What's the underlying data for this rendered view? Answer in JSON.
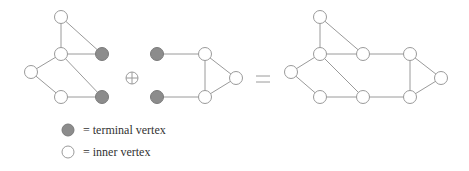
{
  "diagram": {
    "operator_symbol": "⊕",
    "equals_symbol": "=",
    "colors": {
      "edge": "#9a9a9a",
      "terminal_fill": "#8c8c8c",
      "inner_fill": "#ffffff"
    },
    "left_graph": {
      "nodes": [
        {
          "id": "a",
          "x": 61,
          "y": 17,
          "type": "inner"
        },
        {
          "id": "b",
          "x": 61,
          "y": 54,
          "type": "inner"
        },
        {
          "id": "c",
          "x": 31,
          "y": 72,
          "type": "inner"
        },
        {
          "id": "d",
          "x": 61,
          "y": 97,
          "type": "inner"
        },
        {
          "id": "t1",
          "x": 102,
          "y": 54,
          "type": "terminal"
        },
        {
          "id": "t2",
          "x": 102,
          "y": 97,
          "type": "terminal"
        }
      ],
      "edges": [
        [
          "a",
          "b"
        ],
        [
          "a",
          "t1"
        ],
        [
          "b",
          "t1"
        ],
        [
          "b",
          "c"
        ],
        [
          "b",
          "t2"
        ],
        [
          "c",
          "d"
        ],
        [
          "d",
          "t2"
        ]
      ]
    },
    "middle_graph": {
      "nodes": [
        {
          "id": "t1",
          "x": 157,
          "y": 54,
          "type": "terminal"
        },
        {
          "id": "t2",
          "x": 157,
          "y": 97,
          "type": "terminal"
        },
        {
          "id": "e",
          "x": 205,
          "y": 54,
          "type": "inner"
        },
        {
          "id": "f",
          "x": 205,
          "y": 97,
          "type": "inner"
        },
        {
          "id": "g",
          "x": 236,
          "y": 78,
          "type": "inner"
        }
      ],
      "edges": [
        [
          "t1",
          "e"
        ],
        [
          "t2",
          "f"
        ],
        [
          "e",
          "f"
        ],
        [
          "e",
          "g"
        ],
        [
          "f",
          "g"
        ]
      ]
    },
    "result_graph": {
      "nodes": [
        {
          "id": "a",
          "x": 320,
          "y": 17,
          "type": "inner"
        },
        {
          "id": "b",
          "x": 320,
          "y": 54,
          "type": "inner"
        },
        {
          "id": "c",
          "x": 291,
          "y": 72,
          "type": "inner"
        },
        {
          "id": "d",
          "x": 320,
          "y": 97,
          "type": "inner"
        },
        {
          "id": "t1",
          "x": 363,
          "y": 54,
          "type": "inner"
        },
        {
          "id": "t2",
          "x": 363,
          "y": 97,
          "type": "inner"
        },
        {
          "id": "e",
          "x": 410,
          "y": 54,
          "type": "inner"
        },
        {
          "id": "f",
          "x": 410,
          "y": 97,
          "type": "inner"
        },
        {
          "id": "g",
          "x": 441,
          "y": 78,
          "type": "inner"
        }
      ],
      "edges": [
        [
          "a",
          "b"
        ],
        [
          "a",
          "t1"
        ],
        [
          "b",
          "t1"
        ],
        [
          "b",
          "c"
        ],
        [
          "b",
          "t2"
        ],
        [
          "c",
          "d"
        ],
        [
          "d",
          "t2"
        ],
        [
          "t1",
          "e"
        ],
        [
          "t2",
          "f"
        ],
        [
          "e",
          "f"
        ],
        [
          "e",
          "g"
        ],
        [
          "f",
          "g"
        ]
      ]
    }
  },
  "legend": {
    "terminal_label": "= terminal vertex",
    "inner_label": "= inner vertex"
  }
}
